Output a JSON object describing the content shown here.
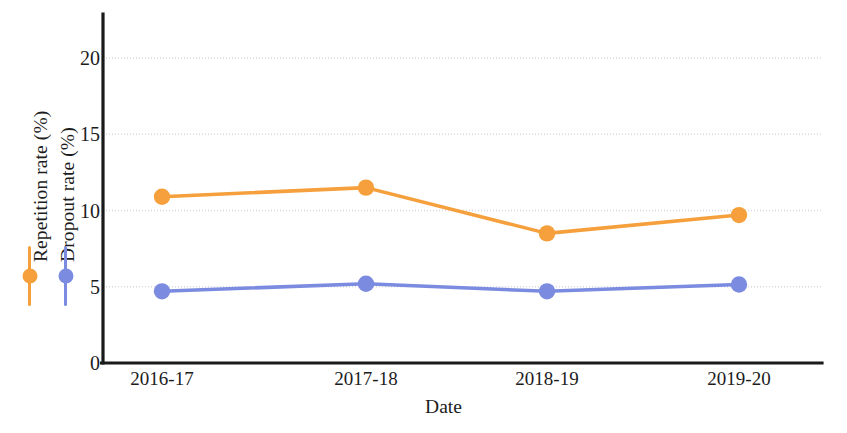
{
  "chart_data": {
    "type": "line",
    "title": "",
    "subtitle": "",
    "xlabel": "Date",
    "ylabel": "Repetition rate (%)  Dropout rate (%)",
    "categories": [
      "2016-17",
      "2017-18",
      "2018-19",
      "2019-20"
    ],
    "x": [
      "2016-17",
      "2017-18",
      "2018-19",
      "2019-20"
    ],
    "series": [
      {
        "name": "Repetition rate (%)",
        "color": "#F5A03C",
        "values": [
          10.9,
          11.5,
          8.5,
          9.7
        ]
      },
      {
        "name": "Dropout rate (%)",
        "color": "#7B8BE0",
        "values": [
          4.7,
          5.2,
          4.7,
          5.15
        ]
      }
    ],
    "yticks": [
      0,
      5,
      10,
      15,
      20
    ],
    "ytick_labels": [
      "0",
      "5",
      "10",
      "15",
      "20"
    ],
    "ylim": [
      0,
      21.5
    ],
    "grid": "horizontal",
    "gridlines_at": [
      5,
      10,
      15,
      20
    ],
    "legend_position": "left-outside-rotated",
    "marker": "circle",
    "axis_color": "#1a1a1a",
    "grid_color": "#d8d8e0",
    "background": "#ffffff"
  },
  "axes": {
    "y_title_part_1": "Repetition rate (%)",
    "y_title_part_2": "Dropout rate (%)",
    "x_title": "Date"
  },
  "ticks": {
    "y": [
      "20",
      "15",
      "10",
      "5",
      "0"
    ],
    "x": [
      "2016-17",
      "2017-18",
      "2018-19",
      "2019-20"
    ]
  },
  "colors": {
    "series_1": "#F5A03C",
    "series_2": "#7B8BE0",
    "axis": "#1a1a1a",
    "grid": "#d8d8e0"
  }
}
